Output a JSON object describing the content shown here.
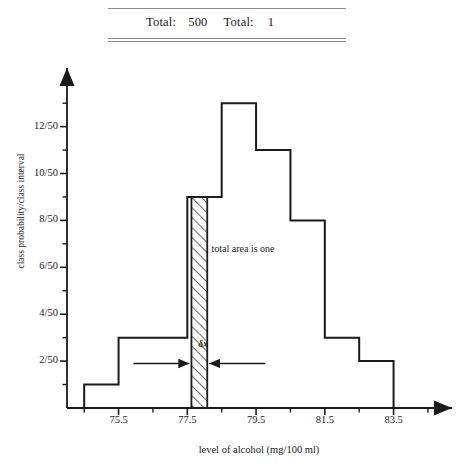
{
  "table_fragment": {
    "total_label_1": "Total:",
    "total_value_1": "500",
    "total_label_2": "Total:",
    "total_value_2": "1"
  },
  "chart_data": {
    "type": "bar",
    "title": "",
    "xlabel": "level of alcohol (mg/100 ml)",
    "ylabel": "class probability/class interval",
    "bin_width": 1,
    "bin_edges": [
      74.5,
      75.5,
      76.5,
      77.5,
      78.5,
      79.5,
      80.5,
      81.5,
      82.5,
      83.5
    ],
    "categories": [
      "74.5-75.5",
      "75.5-76.5",
      "76.5-77.5",
      "77.5-78.5",
      "78.5-79.5",
      "79.5-80.5",
      "80.5-81.5",
      "81.5-82.5",
      "82.5-83.5"
    ],
    "values": [
      0.02,
      0.06,
      0.06,
      0.18,
      0.26,
      0.22,
      0.16,
      0.06,
      0.04
    ],
    "values_as_fractions": [
      "1/50",
      "3/50",
      "3/50",
      "9/50",
      "13/50",
      "11/50",
      "8/50",
      "3/50",
      "2/50"
    ],
    "xlim": [
      74.0,
      85.2
    ],
    "ylim": [
      0,
      0.29
    ],
    "grid": false,
    "legend": null,
    "xtick_labels": [
      "75.5",
      "77.5",
      "79.5",
      "81.5",
      "83.5"
    ],
    "xtick_values": [
      75.5,
      77.5,
      79.5,
      81.5,
      83.5
    ],
    "xminor_tick_values": [
      74.5,
      76.5,
      78.5,
      80.5,
      82.5,
      84.5
    ],
    "ytick_labels": [
      "2/50",
      "4/50",
      "6/50",
      "8/50",
      "10/50",
      "12/50"
    ],
    "ytick_values": [
      0.04,
      0.08,
      0.12,
      0.16,
      0.2,
      0.24
    ],
    "yminor_tick_values": [
      0.02,
      0.06,
      0.1,
      0.14,
      0.18,
      0.22,
      0.26
    ],
    "annotations": [
      {
        "name": "total-area",
        "text": "total area is one",
        "x": 79.6,
        "y": 0.135
      },
      {
        "name": "delta-x",
        "text": "δx",
        "x": 78.05,
        "y": 0.053
      }
    ],
    "highlight_strip": {
      "label": "δx",
      "x_start": 77.62,
      "x_end": 78.08,
      "height": 0.18,
      "hatched": true
    }
  },
  "colors": {
    "ink": "#1a1a1a",
    "rule": "#8a8a8a",
    "background": "#ffffff"
  }
}
